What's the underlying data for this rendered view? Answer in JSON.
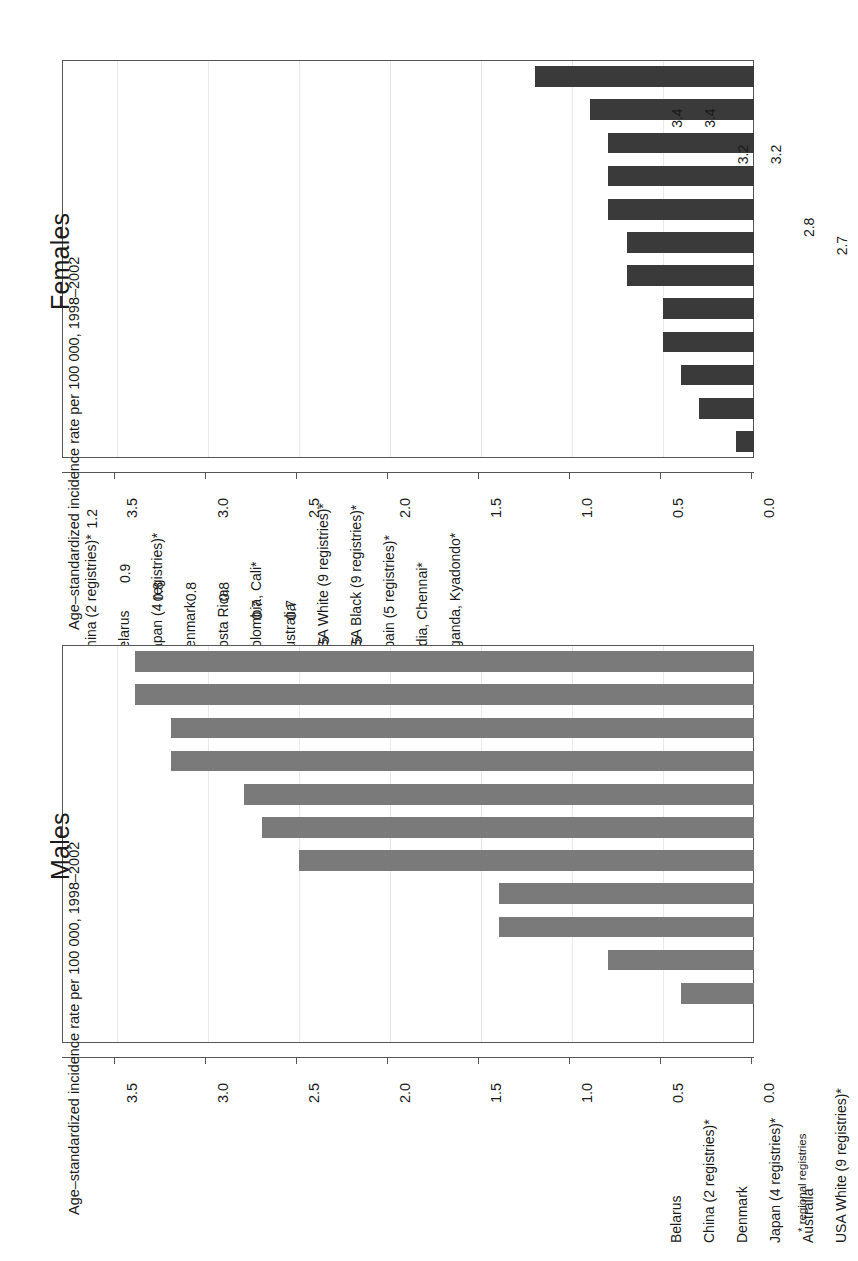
{
  "figure": {
    "axis_title": "Age–standardized incidence rate per 100 000, 1998–2002",
    "footnote": "* regional registries",
    "bar_color_females": "#3a3a3a",
    "bar_color_males": "#7a7a7a",
    "axis_ticks": [
      "0.0",
      "0.5",
      "1.0",
      "1.5",
      "2.0",
      "2.5",
      "3.0",
      "3.5"
    ]
  },
  "panels": [
    {
      "title": "Females"
    },
    {
      "title": "Males"
    }
  ],
  "chart_data": [
    {
      "type": "bar",
      "title": "Females",
      "xlabel": "",
      "ylabel": "Age–standardized incidence rate per 100 000, 1998–2002",
      "ylim": [
        0,
        3.8
      ],
      "yticks": [
        0.0,
        0.5,
        1.0,
        1.5,
        2.0,
        2.5,
        3.0,
        3.5
      ],
      "grid": true,
      "legend": "none",
      "orientation": "rotated-90",
      "categories": [
        "China (2 registries)*",
        "Belarus",
        "Japan (4 registries)*",
        "Denmark",
        "Costa Rica",
        "Colombia, Cali*",
        "Australia",
        "USA White (9 registries)*",
        "USA Black (9 registries)*",
        "Spain (5 registries)*",
        "India, Chennai*",
        "Uganda, Kyadondo*"
      ],
      "values": [
        1.2,
        0.9,
        0.8,
        0.8,
        0.8,
        0.7,
        0.7,
        0.5,
        0.5,
        0.4,
        0.3,
        0.1
      ],
      "value_labels": [
        "1.2",
        "0.9",
        "0.8",
        "0.8",
        "0.8",
        "0.7",
        "0.7",
        "0.5",
        "0.5",
        "0.4",
        "0.3",
        "0.1"
      ]
    },
    {
      "type": "bar",
      "title": "Males",
      "xlabel": "",
      "ylabel": "Age–standardized incidence rate per 100 000, 1998–2002",
      "ylim": [
        0,
        3.8
      ],
      "yticks": [
        0.0,
        0.5,
        1.0,
        1.5,
        2.0,
        2.5,
        3.0,
        3.5
      ],
      "grid": true,
      "legend": "none",
      "orientation": "rotated-90",
      "categories": [
        "Belarus",
        "China (2 registries)*",
        "Denmark",
        "Japan (4 registries)*",
        "Australia",
        "USA White (9 registries)*",
        "Costa Rica",
        "USA Black (9 registries)*",
        "Colombia, Cali*",
        "India, Chennai*",
        "Spain (5 registries)*",
        "Uganda, Kyadondo*"
      ],
      "values": [
        3.4,
        3.4,
        3.2,
        3.2,
        2.8,
        2.7,
        2.5,
        1.4,
        1.4,
        0.8,
        0.4,
        0.0
      ],
      "value_labels": [
        "3.4",
        "3.4",
        "3.2",
        "3.2",
        "2.8",
        "2.7",
        "2.5",
        "1.4",
        "1.4",
        "0.8",
        "0.4",
        "0.0"
      ]
    }
  ]
}
